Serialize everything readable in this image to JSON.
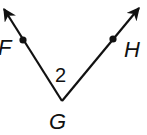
{
  "diagram": {
    "type": "angle",
    "angle_label": "2",
    "vertex": {
      "label": "G",
      "x": 62,
      "y": 101
    },
    "rays": [
      {
        "name": "ray-GF",
        "point_label": "F",
        "point": {
          "x": 23,
          "y": 40
        },
        "tip": {
          "x": 3,
          "y": 8
        }
      },
      {
        "name": "ray-GH",
        "point_label": "H",
        "point": {
          "x": 113,
          "y": 39
        },
        "tip": {
          "x": 140,
          "y": 7
        }
      }
    ],
    "colors": {
      "stroke": "#111111",
      "background": "#ffffff"
    }
  }
}
